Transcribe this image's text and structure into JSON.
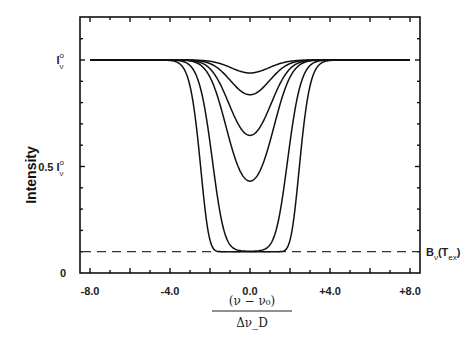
{
  "chart_data": {
    "type": "line",
    "title": "",
    "xlabel_numerator": "(ν − ν₀)",
    "xlabel_denominator": "Δν_D",
    "ylabel": "Intensity",
    "xlim": [
      -8.5,
      8.5
    ],
    "ylim": [
      0,
      1.2
    ],
    "x_ticks": [
      -8.0,
      -4.0,
      0.0,
      4.0,
      8.0
    ],
    "x_tick_labels": [
      "-8.0",
      "-4.0",
      "0.0",
      "+4.0",
      "+8.0"
    ],
    "y_tick_labels": [
      {
        "value": 1.0,
        "label": "I",
        "sub": "ν",
        "sup": "o"
      },
      {
        "value": 0.5,
        "label": "0.5 I",
        "sub": "ν",
        "sup": "o"
      },
      {
        "value": 0.0,
        "label": "0",
        "sub": "",
        "sup": ""
      }
    ],
    "continuum": 1.0,
    "source_function_level": 0.1,
    "source_function_label": {
      "main": "B",
      "sub1": "ν",
      "paren": "(T",
      "sub2": "ex",
      "close": ")"
    },
    "profile_width": 1.3,
    "series": [
      {
        "name": "tau_0.07",
        "tau": 0.07,
        "center_value": 0.94
      },
      {
        "name": "tau_0.2",
        "tau": 0.2,
        "center_value": 0.84
      },
      {
        "name": "tau_0.5",
        "tau": 0.5,
        "center_value": 0.65
      },
      {
        "name": "tau_1",
        "tau": 1.0,
        "center_value": 0.43
      },
      {
        "name": "tau_6",
        "tau": 6.0,
        "center_value": 0.1
      },
      {
        "name": "tau_30",
        "tau": 30.0,
        "center_value": 0.1
      }
    ],
    "grid": false,
    "legend": null
  }
}
